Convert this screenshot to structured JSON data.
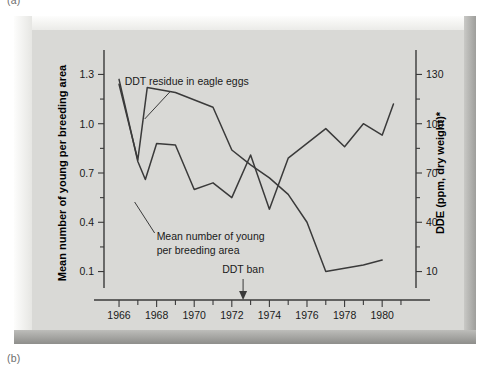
{
  "figure": {
    "part_label_top": "(a)",
    "part_label_bottom": "(b)",
    "footnote": "*DDT is converted to DDE in the birds' bodies"
  },
  "chart_data": {
    "type": "line",
    "title": "",
    "xlabel": "Year",
    "ylabel": "Mean number of young per breeding area",
    "y2label": "DDE (ppm, dry weight)*",
    "grid": false,
    "legend_position": "inline-annotations",
    "xlim": [
      1965.2,
      1981.8
    ],
    "xticks": [
      1966,
      1968,
      1970,
      1972,
      1974,
      1976,
      1978,
      1980
    ],
    "xtick_labels": [
      "1966",
      "1968",
      "1970",
      "1972",
      "1974",
      "1976",
      "1978",
      "1980"
    ],
    "xminor_ticks": [
      1967,
      1969,
      1971,
      1973,
      1975,
      1977,
      1979,
      1981
    ],
    "ylim": [
      0.0,
      1.4
    ],
    "yticks": [
      0.1,
      0.4,
      0.7,
      1.0,
      1.3
    ],
    "ytick_labels": [
      "0.1",
      "0.4",
      "0.7",
      "1.0",
      "1.3"
    ],
    "yminor_ticks": [
      0.25,
      0.55,
      0.85,
      1.15
    ],
    "y2lim": [
      0,
      140
    ],
    "y2ticks": [
      10,
      40,
      70,
      100,
      130
    ],
    "y2tick_labels": [
      "10",
      "40",
      "70",
      "100",
      "130"
    ],
    "y2minor_ticks": [
      25,
      55,
      85,
      115
    ],
    "series": [
      {
        "name": "Mean number of young per breeding area",
        "axis": "left",
        "label": "Mean number of young\nper breeding area",
        "x": [
          1966,
          1967,
          1967.4,
          1968,
          1969,
          1970,
          1971,
          1972,
          1973,
          1974,
          1975,
          1976,
          1977,
          1978,
          1979,
          1980,
          1980.6
        ],
        "y": [
          1.27,
          0.77,
          0.66,
          0.88,
          0.87,
          0.6,
          0.64,
          0.55,
          0.81,
          0.48,
          0.79,
          0.88,
          0.97,
          0.86,
          1.0,
          0.93,
          1.12
        ]
      },
      {
        "name": "DDT residue in eagle eggs",
        "axis": "right",
        "label": "DDT residue in eagle eggs",
        "x": [
          1966,
          1967,
          1967.5,
          1969,
          1971,
          1972,
          1973,
          1974,
          1975,
          1976,
          1977,
          1978,
          1979,
          1980
        ],
        "y": [
          124,
          78,
          122,
          119,
          110,
          84,
          75,
          67,
          57,
          40,
          10,
          12,
          14,
          17
        ]
      }
    ],
    "annotations": [
      {
        "name": "ddt-residue-label",
        "text": "DDT residue in eagle eggs",
        "x": 1969.6,
        "y_px": 55
      },
      {
        "name": "mean-young-label",
        "line1": "Mean number of young",
        "line2": "per breeding area",
        "x": 1968.0,
        "y_px": 210
      },
      {
        "name": "ddt-ban-label",
        "text": "DDT ban",
        "x": 1972.6,
        "arrow_x": 1972.6,
        "y_px": 243
      }
    ]
  },
  "colors": {
    "panel": "#d9d9d6",
    "line": "#3a3a3a",
    "text": "#1a1a1a",
    "page": "#ffffff"
  }
}
